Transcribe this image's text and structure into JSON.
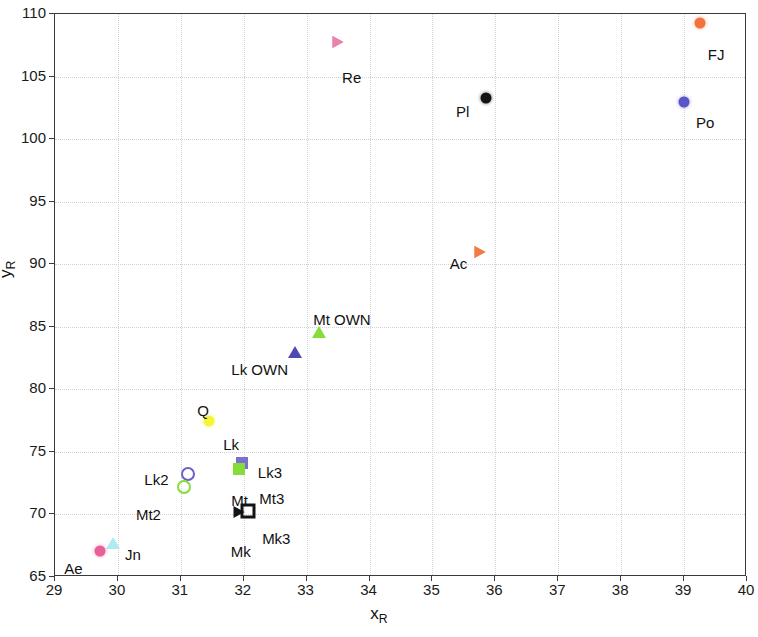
{
  "chart_data": {
    "type": "scatter",
    "title": "",
    "xlabel": "x_R",
    "ylabel": "y_R",
    "xlim": [
      29,
      40
    ],
    "ylim": [
      65,
      110
    ],
    "xticks": [
      29,
      30,
      31,
      32,
      33,
      34,
      35,
      36,
      37,
      38,
      39,
      40
    ],
    "yticks": [
      65,
      70,
      75,
      80,
      85,
      90,
      95,
      100,
      105,
      110
    ],
    "grid": true,
    "legend": "none (points annotated with text labels)",
    "points": [
      {
        "label": "FJ",
        "x": 39.25,
        "y": 109.3,
        "marker": "circle-filled",
        "color": "#f2743c",
        "label_dx": 8,
        "label_dy": 24
      },
      {
        "label": "Re",
        "x": 33.5,
        "y": 107.8,
        "marker": "tri-right-open",
        "color": "#e87ca8",
        "label_dx": 4,
        "label_dy": 28
      },
      {
        "label": "Po",
        "x": 39.0,
        "y": 103.0,
        "marker": "circle-filled",
        "color": "#5a56c8",
        "label_dx": 12,
        "label_dy": 13
      },
      {
        "label": "Pl",
        "x": 35.85,
        "y": 103.3,
        "marker": "circle-filled",
        "color": "#141414",
        "label_dx": -30,
        "label_dy": 6
      },
      {
        "label": "Ac",
        "x": 35.75,
        "y": 91.0,
        "marker": "tri-right-open",
        "color": "#f2743c",
        "label_dx": -30,
        "label_dy": 4
      },
      {
        "label": "Mt OWN",
        "x": 33.2,
        "y": 84.6,
        "marker": "tri-up-open",
        "color": "#86dd3a",
        "label_dx": -6,
        "label_dy": -20
      },
      {
        "label": "Lk OWN",
        "x": 32.82,
        "y": 83.0,
        "marker": "tri-up-filled",
        "color": "#4f49b4",
        "label_dx": -64,
        "label_dy": 10
      },
      {
        "label": "Q",
        "x": 31.45,
        "y": 77.5,
        "marker": "circle-filled",
        "color": "#f7f53a",
        "label_dx": -12,
        "label_dy": -18
      },
      {
        "label": "Lk",
        "x": 31.45,
        "y": 77.5,
        "marker": "none",
        "color": "#f7f53a",
        "label_dx": 14,
        "label_dy": 16
      },
      {
        "label": "Lk3",
        "x": 31.97,
        "y": 74.1,
        "marker": "square-filled",
        "color": "#7b6fd0",
        "label_dx": 16,
        "label_dy": 2
      },
      {
        "label": "Mt",
        "x": 31.93,
        "y": 73.6,
        "marker": "square-filled",
        "color": "#86dd3a",
        "label_dx": -8,
        "label_dy": 24
      },
      {
        "label": "Mt3",
        "x": 31.93,
        "y": 73.6,
        "marker": "none",
        "color": "#86dd3a",
        "label_dx": 20,
        "label_dy": 22
      },
      {
        "label": "Lk2",
        "x": 31.12,
        "y": 73.2,
        "marker": "circle-open",
        "color": "#6a60c8",
        "label_dx": -44,
        "label_dy": -2
      },
      {
        "label": "Mt2",
        "x": 31.05,
        "y": 72.2,
        "marker": "circle-open",
        "color": "#86dd3a",
        "label_dx": -48,
        "label_dy": 20
      },
      {
        "label": "Mk",
        "x": 31.92,
        "y": 70.2,
        "marker": "tri-right-filled",
        "color": "#141414",
        "label_dx": -8,
        "label_dy": 32
      },
      {
        "label": "Mk3",
        "x": 32.07,
        "y": 70.3,
        "marker": "square-open",
        "color": "#141414",
        "label_dx": 14,
        "label_dy": 20
      },
      {
        "label": "Jn",
        "x": 29.92,
        "y": 67.7,
        "marker": "tri-up-open",
        "color": "#aeeaf2",
        "label_dx": 12,
        "label_dy": 4
      },
      {
        "label": "Ae",
        "x": 29.72,
        "y": 67.1,
        "marker": "circle-filled",
        "color": "#e8609a",
        "label_dx": -36,
        "label_dy": 10
      }
    ]
  },
  "axis": {
    "x_title_main": "x",
    "x_title_sub": "R",
    "y_title_main": "y",
    "y_title_sub": "R"
  }
}
